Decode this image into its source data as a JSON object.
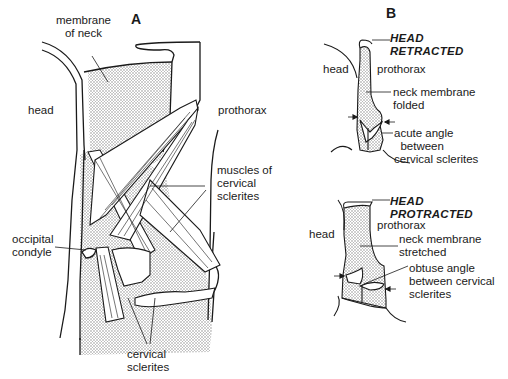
{
  "panels": {
    "A": {
      "letter": "A",
      "labels": {
        "membrane_of_neck": "membrane\nof neck",
        "head": "head",
        "prothorax": "prothorax",
        "muscles": "muscles of\ncervical\nsclerites",
        "occipital_condyle": "occipital\ncondyle",
        "cervical_sclerites": "cervical\nsclerites"
      }
    },
    "B": {
      "letter": "B",
      "retracted": {
        "state": "HEAD\nRETRACTED",
        "head": "head",
        "prothorax": "prothorax",
        "membrane": "neck membrane\nfolded",
        "angle": "acute angle\n  between\ncervical sclerites"
      },
      "protracted": {
        "state": "HEAD\nPROTRACTED",
        "head": "head",
        "prothorax": "prothorax",
        "membrane": "neck membrane\nstretched",
        "angle": "obtuse angle\nbetween cervical\nsclerites"
      }
    }
  },
  "colors": {
    "line": "#1a1a1a",
    "stipple_fill": "#d9d9d9",
    "background": "#ffffff"
  }
}
